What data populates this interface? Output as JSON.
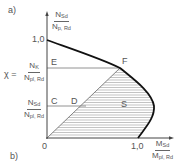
{
  "panel_labels": {
    "a": "a)",
    "b": "b)"
  },
  "y_axis": {
    "label_num_main": "N",
    "label_num_sub": "Sd",
    "label_den_main": "N",
    "label_den_sub": "p, Rd",
    "tick_top": "1,0"
  },
  "x_axis": {
    "label_num_main": "M",
    "label_num_sub": "Sd",
    "label_den_main": "M",
    "label_den_sub": "pl, Rd",
    "tick_origin": "0",
    "tick_right": "1,0"
  },
  "chi_label": {
    "prefix": "χ =",
    "num_main": "N",
    "num_sub": "K",
    "den_main": "N",
    "den_sub": "pl, Rd"
  },
  "nsd_label": {
    "num_main": "N",
    "num_sub": "Sd",
    "den_main": "N",
    "den_sub": "pl, Rd"
  },
  "points": {
    "E": "E",
    "F": "F",
    "C": "C",
    "D": "D",
    "S": "S"
  },
  "colors": {
    "curve": "#111111",
    "axis": "#444444",
    "hatch": "#9a9a9a",
    "text": "#555555"
  }
}
